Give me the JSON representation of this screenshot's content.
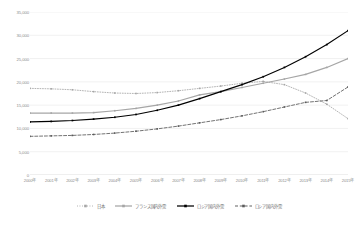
{
  "chart_data": {
    "type": "line",
    "title": "",
    "xlabel": "",
    "ylabel": "",
    "ylim": [
      0,
      35000
    ],
    "ytick_step": 5000,
    "grid": true,
    "legend_position": "bottom",
    "categories": [
      "2000年",
      "2001年",
      "2002年",
      "2003年",
      "2004年",
      "2005年",
      "2006年",
      "2007年",
      "2008年",
      "2009年",
      "2010年",
      "2011年",
      "2012年",
      "2013年",
      "2014年",
      "2015年"
    ],
    "ytick_labels": [
      "35,000",
      "30,000",
      "25,000",
      "20,000",
      "15,000",
      "10,000",
      "5,000",
      "0"
    ],
    "ytick_values": [
      35000,
      30000,
      25000,
      20000,
      15000,
      10000,
      5000,
      0
    ],
    "series": [
      {
        "name": "日本",
        "style": "dotted",
        "color": "#a6a6a6",
        "marker": "square",
        "values": [
          18600,
          18500,
          18300,
          17900,
          17600,
          17500,
          17700,
          18100,
          18600,
          19100,
          19700,
          20100,
          19400,
          17600,
          15200,
          12100
        ]
      },
      {
        "name": "フランス国内外需",
        "style": "solid",
        "color": "#a6a6a6",
        "marker": "square",
        "values": [
          13300,
          13300,
          13300,
          13400,
          13800,
          14300,
          15000,
          15900,
          17200,
          17900,
          18800,
          19700,
          20600,
          21600,
          23100,
          25000
        ]
      },
      {
        "name": "ロシア国内外需",
        "style": "solid",
        "color": "#000000",
        "marker": "square",
        "values": [
          11400,
          11500,
          11700,
          12000,
          12400,
          13000,
          13900,
          15000,
          16400,
          17900,
          19400,
          21100,
          23100,
          25400,
          28000,
          31000
        ]
      },
      {
        "name": "ロシア国内外需",
        "style": "dashed",
        "color": "#5a5a5a",
        "marker": "square",
        "values": [
          8300,
          8400,
          8500,
          8700,
          9000,
          9400,
          9900,
          10500,
          11200,
          11900,
          12700,
          13600,
          14600,
          15600,
          16000,
          18900
        ]
      }
    ]
  }
}
